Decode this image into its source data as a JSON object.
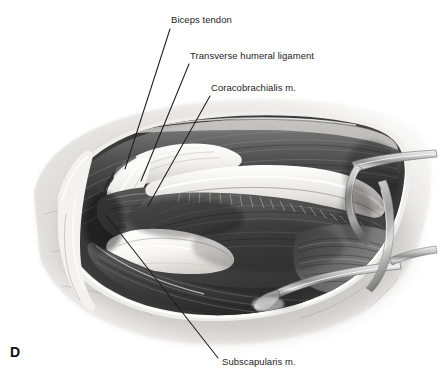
{
  "figure": {
    "panel_letter": "D",
    "type": "grayscale anatomical surgical illustration",
    "background_color": "#ffffff",
    "ink_color": "#1d1d1d"
  },
  "labels": [
    {
      "id": "biceps-tendon",
      "text": "Biceps tendon"
    },
    {
      "id": "transverse-humeral-ligament",
      "text": "Transverse humeral ligament"
    },
    {
      "id": "coracobrachialis",
      "text": "Coracobrachialis m."
    },
    {
      "id": "subscapularis",
      "text": "Subscapularis m."
    }
  ]
}
